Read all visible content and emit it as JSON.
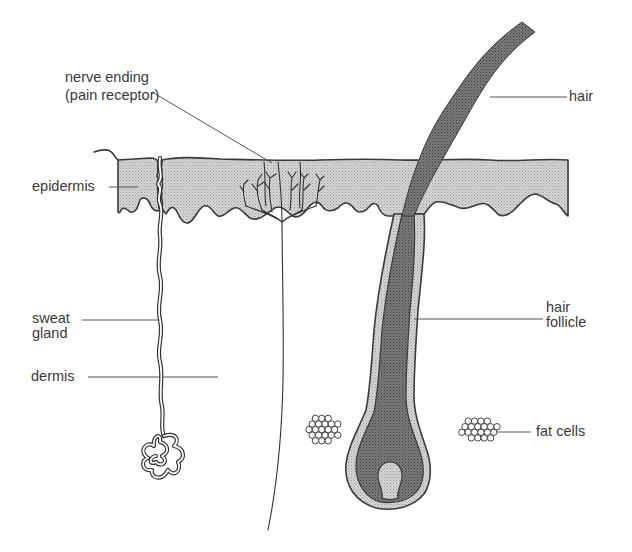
{
  "diagram": {
    "labels": {
      "nerve_ending_line1": "nerve ending",
      "nerve_ending_line2": "(pain receptor)",
      "hair": "hair",
      "epidermis": "epidermis",
      "sweat_gland_line1": "sweat",
      "sweat_gland_line2": "gland",
      "dermis": "dermis",
      "hair_follicle_line1": "hair",
      "hair_follicle_line2": "follicle",
      "fat_cells": "fat cells"
    },
    "colors": {
      "epidermis_fill": "#c8c8c8",
      "hair_fill": "#6a6a6a",
      "follicle_sheath_fill": "#c2c2c2",
      "papilla_fill": "#c8c8c8",
      "outline": "#3a3a3a",
      "text": "#3a3a3a"
    }
  }
}
